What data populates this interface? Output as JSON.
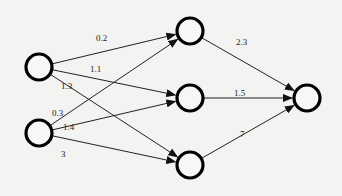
{
  "diagram": {
    "type": "neural-network",
    "layers": [
      {
        "name": "input",
        "nodes": [
          {
            "id": "i1",
            "x": 39,
            "y": 67
          },
          {
            "id": "i2",
            "x": 39,
            "y": 133
          }
        ]
      },
      {
        "name": "hidden",
        "nodes": [
          {
            "id": "h1",
            "x": 190,
            "y": 31
          },
          {
            "id": "h2",
            "x": 190,
            "y": 98
          },
          {
            "id": "h3",
            "x": 190,
            "y": 165
          }
        ]
      },
      {
        "name": "output",
        "nodes": [
          {
            "id": "o1",
            "x": 307,
            "y": 98
          }
        ]
      }
    ],
    "node_radius": 13,
    "edges": [
      {
        "from": "i1",
        "to": "h1",
        "weight": "0.2",
        "label_x": 96,
        "label_y": 41
      },
      {
        "from": "i1",
        "to": "h2",
        "weight": "1.1",
        "label_x": 90,
        "label_y": 72
      },
      {
        "from": "i1",
        "to": "h3",
        "weight": "1.3",
        "label_x": 61,
        "label_y": 89
      },
      {
        "from": "i2",
        "to": "h1",
        "weight": "0.3",
        "label_x": 52,
        "label_y": 116
      },
      {
        "from": "i2",
        "to": "h2",
        "weight": "1.4",
        "label_x": 63,
        "label_y": 130
      },
      {
        "from": "i2",
        "to": "h3",
        "weight": "3",
        "label_x": 61,
        "label_y": 157
      },
      {
        "from": "h1",
        "to": "o1",
        "weight": "2.3",
        "label_x": 236,
        "label_y": 45
      },
      {
        "from": "h2",
        "to": "o1",
        "weight": "1.5",
        "label_x": 234,
        "label_y": 96
      },
      {
        "from": "h3",
        "to": "o1",
        "weight": "7",
        "label_x": 240,
        "label_y": 137
      }
    ]
  }
}
